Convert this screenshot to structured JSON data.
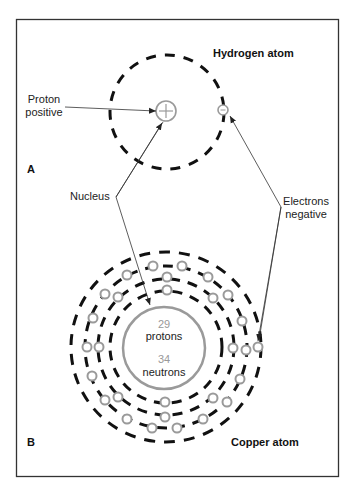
{
  "panel_a": {
    "label": "A",
    "title": "Hydrogen atom",
    "proton_label_line1": "Proton",
    "proton_label_line2": "positive"
  },
  "shared_labels": {
    "nucleus": "Nucleus",
    "electrons_line1": "Electrons",
    "electrons_line2": "negative"
  },
  "panel_b": {
    "label": "B",
    "title": "Copper atom",
    "protons_count": "29",
    "protons_label": "protons",
    "neutrons_count": "34",
    "neutrons_label": "neutrons"
  },
  "colors": {
    "frame": "#333333",
    "orbit": "#111111",
    "particle": "#9a9a9a",
    "leader": "#333333"
  }
}
